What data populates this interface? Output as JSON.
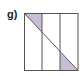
{
  "figure": {
    "label": "g)",
    "shape": "square",
    "strips": 3,
    "shaded_regions": 2,
    "colors": {
      "shade": "#c9bcd6",
      "line": "#555555",
      "background": "#ffffff"
    }
  }
}
